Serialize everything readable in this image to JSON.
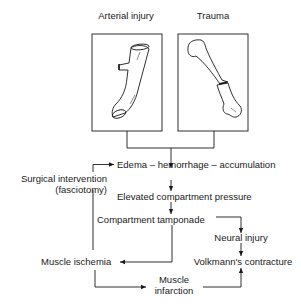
{
  "panels": {
    "left": {
      "title": "Arterial injury",
      "illustration": "artery-segment-with-branch"
    },
    "right": {
      "title": "Trauma",
      "illustration": "fractured-long-bone"
    }
  },
  "flow": {
    "edema": "Edema – hemorrhage – accumulation",
    "surgical_line1": "Surgical intervention",
    "surgical_line2": "(fasciotomy)",
    "elevated": "Elevated compartment pressure",
    "tamponade": "Compartment tamponade",
    "neural": "Neural injury",
    "ischemia": "Muscle ischemia",
    "volkmann": "Volkmann's contracture",
    "infarction_line1": "Muscle",
    "infarction_line2": "infarction"
  },
  "colors": {
    "line": "#1a1a1a",
    "background": "#ffffff"
  }
}
